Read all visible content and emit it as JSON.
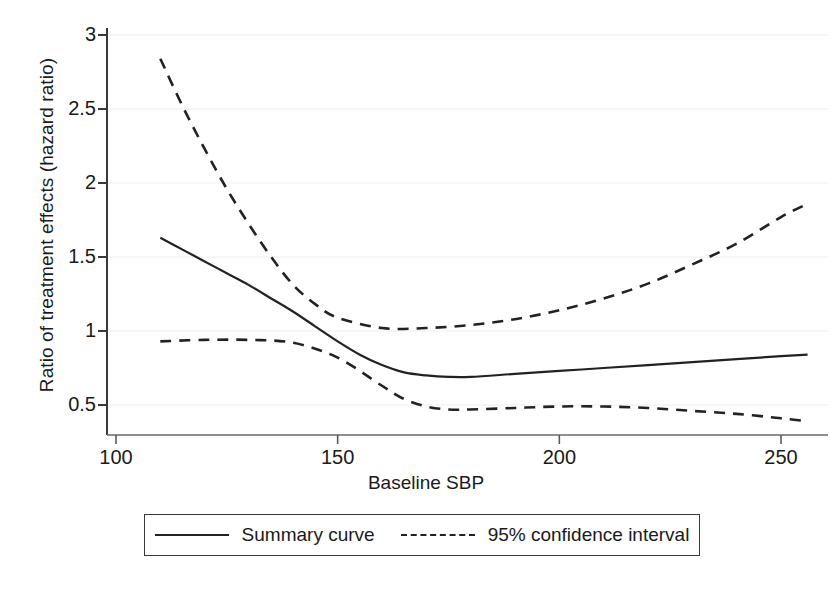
{
  "chart_data": {
    "type": "line",
    "title": "",
    "xlabel": "Baseline SBP",
    "ylabel": "Ratio of treatment effects (hazard ratio)",
    "xlim": [
      106,
      267
    ],
    "ylim": [
      0.29,
      3.05
    ],
    "xticks": [
      100,
      150,
      200,
      250
    ],
    "xtick_labels": [
      "100",
      "150",
      "200",
      "250"
    ],
    "yticks": [
      0.5,
      1,
      1.5,
      2,
      2.5,
      3
    ],
    "ytick_labels": [
      "0.5",
      "1",
      "1.5",
      "2",
      "2.5",
      "3"
    ],
    "grid": "horizontal-faint",
    "legend_position": "below-axes",
    "series": [
      {
        "name": "Summary curve",
        "style": "solid",
        "color": "#222222",
        "x": [
          110,
          115,
          120,
          125,
          130,
          135,
          140,
          145,
          150,
          155,
          160,
          165,
          170,
          175,
          180,
          190,
          200,
          210,
          220,
          230,
          240,
          250,
          256
        ],
        "y": [
          1.63,
          1.55,
          1.47,
          1.39,
          1.31,
          1.22,
          1.13,
          1.03,
          0.93,
          0.84,
          0.77,
          0.72,
          0.7,
          0.69,
          0.69,
          0.71,
          0.73,
          0.75,
          0.77,
          0.79,
          0.81,
          0.83,
          0.84
        ]
      },
      {
        "name": "95% confidence interval upper",
        "style": "dashed",
        "color": "#222222",
        "x": [
          110,
          115,
          120,
          125,
          130,
          135,
          140,
          145,
          150,
          160,
          170,
          180,
          190,
          200,
          210,
          220,
          230,
          240,
          250,
          256
        ],
        "y": [
          2.84,
          2.52,
          2.23,
          1.96,
          1.72,
          1.5,
          1.31,
          1.18,
          1.09,
          1.02,
          1.02,
          1.04,
          1.08,
          1.14,
          1.22,
          1.32,
          1.45,
          1.59,
          1.77,
          1.86
        ]
      },
      {
        "name": "95% confidence interval lower",
        "style": "dashed",
        "color": "#222222",
        "x": [
          110,
          120,
          130,
          140,
          150,
          160,
          165,
          170,
          175,
          180,
          190,
          200,
          210,
          220,
          230,
          240,
          250,
          256
        ],
        "y": [
          0.93,
          0.94,
          0.94,
          0.92,
          0.82,
          0.63,
          0.54,
          0.49,
          0.47,
          0.47,
          0.48,
          0.49,
          0.49,
          0.48,
          0.46,
          0.44,
          0.41,
          0.39
        ]
      }
    ]
  },
  "legend": {
    "entries": [
      {
        "label": "Summary curve",
        "style": "solid"
      },
      {
        "label": "95% confidence interval",
        "style": "dashed"
      }
    ]
  }
}
